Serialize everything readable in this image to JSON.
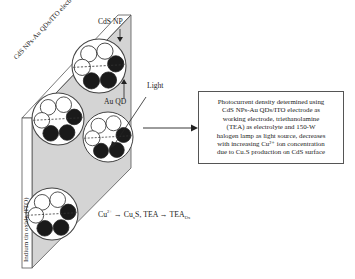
{
  "electrode": {
    "top_label": "CdS NPs-Au QDs/ITO electrode",
    "side_label": "Indium tin oxide (ITO)",
    "face_color": "#d4d4d4",
    "edge_color": "#ffffff",
    "outline_color": "#555555"
  },
  "labels": {
    "cds_np": "CdS NP",
    "au_qd": "Au QD",
    "light": "Light"
  },
  "reaction": {
    "cu_ion": "Cu",
    "cu_charge": "2+",
    "arrow1": " → Cu",
    "cu_sub": "x",
    "s": "S, TEA → TEA",
    "tea_sub": "Ox"
  },
  "description": {
    "lines": [
      "Photocurrent density determined using",
      "CdS NPs-Au QDs/ITO electrode as",
      "working electrode, triethanolamine",
      "(TEA) as electrolyte and 150-W",
      "halogen lamp as light source, decreases",
      "with increasing Cu²⁺ ion concentration",
      "due to CuₓS production on CdS surface"
    ]
  },
  "clusters": [
    {
      "cx": 99,
      "cy": 66,
      "r": 27
    },
    {
      "cx": 58,
      "cy": 119,
      "r": 26
    },
    {
      "cx": 108,
      "cy": 137,
      "r": 25
    },
    {
      "cx": 52,
      "cy": 214,
      "r": 26
    }
  ]
}
